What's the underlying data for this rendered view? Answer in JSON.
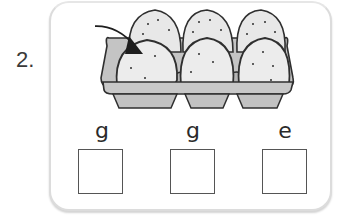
{
  "question": {
    "number": "2.",
    "image": {
      "subject": "egg-carton",
      "eggs_count": 6,
      "arrow_points_to": "front-left egg"
    },
    "letters": [
      "g",
      "g",
      "e"
    ],
    "answer_boxes": [
      {
        "value": ""
      },
      {
        "value": ""
      },
      {
        "value": ""
      }
    ]
  },
  "colors": {
    "card_border": "#dcdcdc",
    "egg_fill": "#e6e6e6",
    "carton_fill": "#bdbdbd",
    "outline": "#2f2f2f"
  }
}
